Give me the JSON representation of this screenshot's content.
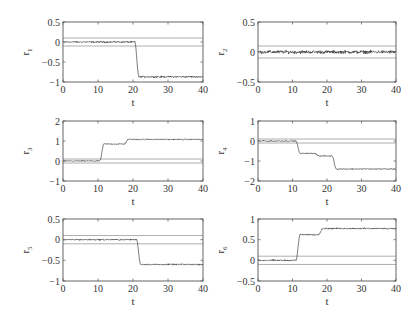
{
  "chart_data": [
    {
      "type": "line",
      "id": "r1",
      "ylabel": "r",
      "ylabel_sub": "1",
      "xlabel": "t",
      "xlim": [
        0,
        40
      ],
      "ylim": [
        -1,
        0.5
      ],
      "xticks": [
        0,
        10,
        20,
        30,
        40
      ],
      "yticks": [
        -1,
        -0.5,
        0,
        0.5
      ],
      "ytick_labels": [
        "−1",
        "−0.5",
        "0",
        "0.5"
      ],
      "thresholds": [
        0.1,
        -0.1
      ],
      "series": [
        {
          "name": "r1",
          "steps": [
            {
              "t": 0,
              "v": 0.0
            },
            {
              "t": 20.5,
              "v": -0.87
            }
          ],
          "noise": 0.03
        }
      ]
    },
    {
      "type": "line",
      "id": "r2",
      "ylabel": "r",
      "ylabel_sub": "2",
      "xlabel": "t",
      "xlim": [
        0,
        40
      ],
      "ylim": [
        -0.5,
        0.5
      ],
      "xticks": [
        0,
        10,
        20,
        30,
        40
      ],
      "yticks": [
        -0.5,
        0,
        0.5
      ],
      "ytick_labels": [
        "−0.5",
        "0",
        "0.5"
      ],
      "thresholds": [
        0.1,
        -0.1
      ],
      "series": [
        {
          "name": "r2",
          "steps": [
            {
              "t": 0,
              "v": 0.0
            }
          ],
          "noise": 0.04
        }
      ]
    },
    {
      "type": "line",
      "id": "r3",
      "ylabel": "r",
      "ylabel_sub": "3",
      "xlabel": "t",
      "xlim": [
        0,
        40
      ],
      "ylim": [
        -1,
        2
      ],
      "xticks": [
        0,
        10,
        20,
        30,
        40
      ],
      "yticks": [
        -1,
        0,
        1,
        2
      ],
      "ytick_labels": [
        "−1",
        "0",
        "1",
        "2"
      ],
      "thresholds": [
        0.1,
        -0.1
      ],
      "series": [
        {
          "name": "r3",
          "steps": [
            {
              "t": 0,
              "v": 0.0
            },
            {
              "t": 10.5,
              "v": 0.85
            },
            {
              "t": 17.5,
              "v": 1.08
            }
          ],
          "noise": 0.04
        }
      ]
    },
    {
      "type": "line",
      "id": "r4",
      "ylabel": "r",
      "ylabel_sub": "4",
      "xlabel": "t",
      "xlim": [
        0,
        40
      ],
      "ylim": [
        -2,
        1
      ],
      "xticks": [
        0,
        10,
        20,
        30,
        40
      ],
      "yticks": [
        -2,
        -1,
        0,
        1
      ],
      "ytick_labels": [
        "−2",
        "−1",
        "0",
        "1"
      ],
      "thresholds": [
        0.1,
        -0.1
      ],
      "series": [
        {
          "name": "r4",
          "steps": [
            {
              "t": 0,
              "v": 0.0
            },
            {
              "t": 11,
              "v": -0.62
            },
            {
              "t": 16.5,
              "v": -0.75
            },
            {
              "t": 21.5,
              "v": -1.4
            }
          ],
          "noise": 0.04
        }
      ]
    },
    {
      "type": "line",
      "id": "r5",
      "ylabel": "r",
      "ylabel_sub": "5",
      "xlabel": "t",
      "xlim": [
        0,
        40
      ],
      "ylim": [
        -1,
        0.5
      ],
      "xticks": [
        0,
        10,
        20,
        30,
        40
      ],
      "yticks": [
        -1,
        -0.5,
        0,
        0.5
      ],
      "ytick_labels": [
        "−1",
        "−0.5",
        "0",
        "0.5"
      ],
      "thresholds": [
        0.1,
        -0.1
      ],
      "series": [
        {
          "name": "r5",
          "steps": [
            {
              "t": 0,
              "v": 0.0
            },
            {
              "t": 21,
              "v": -0.6
            }
          ],
          "noise": 0.025
        }
      ]
    },
    {
      "type": "line",
      "id": "r6",
      "ylabel": "r",
      "ylabel_sub": "6",
      "xlabel": "t",
      "xlim": [
        0,
        40
      ],
      "ylim": [
        -0.5,
        1
      ],
      "xticks": [
        0,
        10,
        20,
        30,
        40
      ],
      "yticks": [
        -0.5,
        0,
        0.5,
        1
      ],
      "ytick_labels": [
        "−0.5",
        "0",
        "0.5",
        "1"
      ],
      "thresholds": [
        0.1,
        -0.1
      ],
      "series": [
        {
          "name": "r6",
          "steps": [
            {
              "t": 0,
              "v": 0.0
            },
            {
              "t": 11,
              "v": 0.62
            },
            {
              "t": 17.5,
              "v": 0.77
            }
          ],
          "noise": 0.025
        }
      ]
    }
  ]
}
